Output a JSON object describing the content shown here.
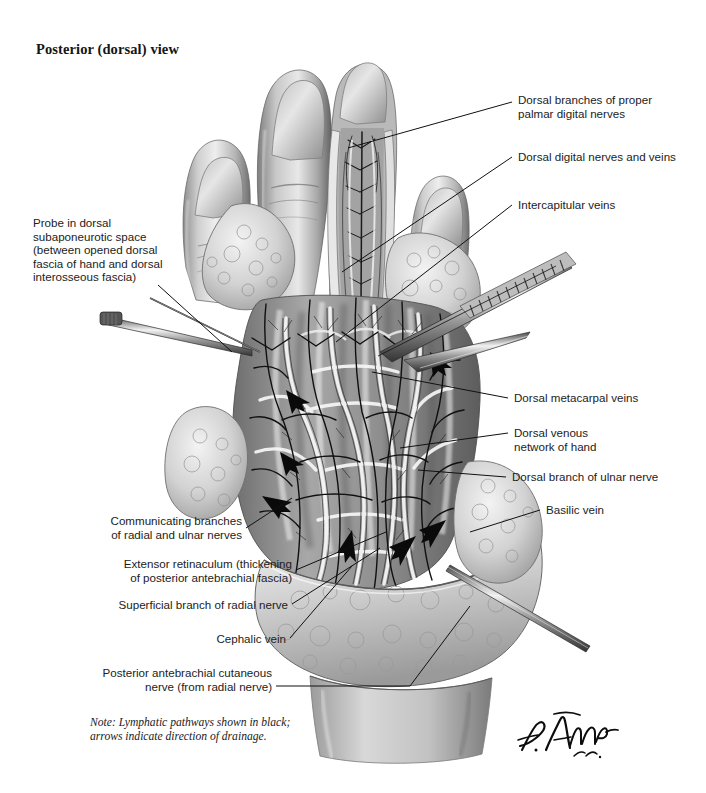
{
  "plate": {
    "title": "Posterior (dorsal) view",
    "background_color": "#ffffff",
    "ink_color": "#1c1c1c",
    "signature": "F. Netter M.D."
  },
  "note": {
    "text": "Note: Lymphatic pathways shown in black;\narrows indicate direction of drainage."
  },
  "labels_right": [
    {
      "id": "dorsal-branches-proper-palmar-digital-nerves",
      "text": "Dorsal branches of proper\npalmar digital nerves"
    },
    {
      "id": "dorsal-digital-nerves-and-veins",
      "text": "Dorsal digital nerves and veins"
    },
    {
      "id": "intercapitular-veins",
      "text": "Intercapitular veins"
    },
    {
      "id": "dorsal-metacarpal-veins",
      "text": "Dorsal metacarpal veins"
    },
    {
      "id": "dorsal-venous-network-of-hand",
      "text": "Dorsal venous\nnetwork of hand"
    },
    {
      "id": "dorsal-branch-of-ulnar-nerve",
      "text": "Dorsal branch of ulnar nerve"
    },
    {
      "id": "basilic-vein",
      "text": "Basilic vein"
    }
  ],
  "labels_left": [
    {
      "id": "probe-in-dorsal-subaponeurotic-space",
      "text": "Probe in dorsal\nsubaponeurotic space\n(between opened dorsal\nfascia of hand and dorsal\ninterosseous fascia)"
    },
    {
      "id": "communicating-branches-radial-ulnar-nerves",
      "text": "Communicating branches\nof radial and ulnar nerves"
    },
    {
      "id": "extensor-retinaculum",
      "text": "Extensor retinaculum (thickening\nof posterior antebrachial fascia)"
    },
    {
      "id": "superficial-branch-of-radial-nerve",
      "text": "Superficial branch of radial nerve"
    },
    {
      "id": "cephalic-vein",
      "text": "Cephalic vein"
    },
    {
      "id": "posterior-antebrachial-cutaneous-nerve",
      "text": "Posterior antebrachial cutaneous\nnerve (from radial nerve)"
    }
  ],
  "illustration": {
    "subject": "dissected dorsum of right hand and wrist",
    "instruments": [
      "surgical-probe-left",
      "serrated-forceps-right",
      "surgical-probe-lower-right"
    ],
    "arrow_count": 7,
    "arrow_meaning": "direction of lymphatic drainage"
  }
}
